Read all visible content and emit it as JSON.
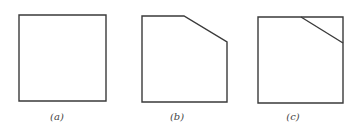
{
  "figure": {
    "panels": [
      {
        "id": "a",
        "label": "(a)",
        "description": "square",
        "points": "19,15 106,15 106,101 19,101",
        "cut_line": null,
        "label_x": 42
      },
      {
        "id": "b",
        "label": "(b)",
        "description": "square with top-right corner chamfered off",
        "points": "142,16 184,16 227,42 227,102 142,102",
        "cut_line": null,
        "label_x": 162
      },
      {
        "id": "c",
        "label": "(c)",
        "description": "square with diagonal line across top-right corner",
        "points": "258,17 343,17 343,103 258,103",
        "cut_line": {
          "x1": 301,
          "y1": 17,
          "x2": 343,
          "y2": 43
        },
        "label_x": 278
      }
    ],
    "stroke_color": "#3a3a3a"
  }
}
